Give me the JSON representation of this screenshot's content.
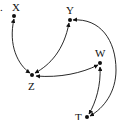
{
  "diagram": {
    "type": "causal-graph",
    "stray_mark": ".",
    "nodes": [
      {
        "id": "X",
        "label": "X"
      },
      {
        "id": "Y",
        "label": "Y"
      },
      {
        "id": "Z",
        "label": "Z"
      },
      {
        "id": "W",
        "label": "W"
      },
      {
        "id": "T",
        "label": "T"
      }
    ],
    "edges": [
      {
        "from": "X",
        "to": "Z",
        "type": "bidirected"
      },
      {
        "from": "Y",
        "to": "Z",
        "type": "bidirected"
      },
      {
        "from": "Z",
        "to": "W",
        "type": "bidirected"
      },
      {
        "from": "W",
        "to": "T",
        "type": "bidirected"
      },
      {
        "from": "Y",
        "to": "T",
        "type": "bidirected"
      }
    ],
    "colors": {
      "ink": "#111111",
      "background": "#ffffff"
    }
  }
}
